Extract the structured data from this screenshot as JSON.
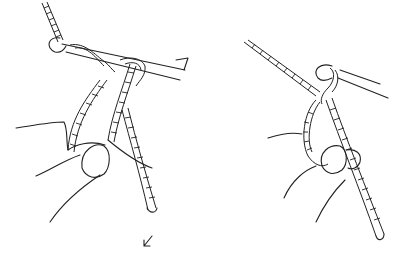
{
  "illustration": {
    "subject": "crochet technique line drawing",
    "figures": [
      {
        "id": "left",
        "description": "hand holding yarn loops over crochet hook, hook pointing right with arrow"
      },
      {
        "id": "right",
        "description": "hand holding yarn with single loop on crochet hook"
      }
    ],
    "arrows": [
      {
        "id": "hook-arrow",
        "direction": "right"
      },
      {
        "id": "bottom-arrow",
        "direction": "down-left"
      }
    ],
    "colors": {
      "ink": "#222222",
      "background": "#ffffff"
    }
  }
}
